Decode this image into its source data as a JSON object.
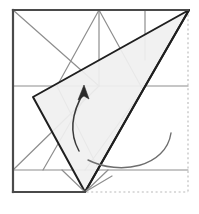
{
  "figure": {
    "canvas": {
      "width": 199,
      "height": 214,
      "background": "#ffffff"
    },
    "paper_square": {
      "label": "paper-outline",
      "x": 13,
      "y": 10,
      "width": 175,
      "height": 182,
      "solid_edges": [
        "top",
        "left"
      ],
      "dashed_edges": [
        "right",
        "bottom"
      ],
      "solid_color": "#4a4a4a",
      "dashed_color": "#b9b9b9",
      "solid_width": 2.2,
      "dashed_width": 1.1,
      "dash_pattern": "2,2.6"
    },
    "flap": {
      "label": "folded-flap",
      "points": "33,97 189,10 143,90 85,192",
      "fill": "#f0f0f0",
      "stroke": "#1f1f1f",
      "stroke_width": 2.0
    },
    "flap_inner_edges": [
      {
        "name": "flap-crease-apex-to-mid",
        "x1": 189,
        "y1": 10,
        "x2": 143,
        "y2": 90,
        "color": "#1f1f1f",
        "width": 2.0
      },
      {
        "name": "flap-crease-mid-to-base",
        "x1": 143,
        "y1": 90,
        "x2": 85,
        "y2": 192,
        "color": "#1f1f1f",
        "width": 2.0
      }
    ],
    "creases": [
      {
        "name": "crease-horizontal-upper",
        "x1": 13,
        "y1": 86,
        "x2": 188,
        "y2": 86,
        "color": "#8e8e8e",
        "width": 1.2
      },
      {
        "name": "crease-horizontal-lower",
        "x1": 13,
        "y1": 170,
        "x2": 188,
        "y2": 170,
        "color": "#8e8e8e",
        "width": 1.2
      },
      {
        "name": "crease-vertical-center",
        "x1": 99,
        "y1": 10,
        "x2": 99,
        "y2": 86,
        "color": "#8e8e8e",
        "width": 1.2
      },
      {
        "name": "crease-vertical-right",
        "x1": 145,
        "y1": 10,
        "x2": 145,
        "y2": 60,
        "color": "#8e8e8e",
        "width": 1.2
      },
      {
        "name": "crease-diagonal-topleft-down",
        "x1": 13,
        "y1": 10,
        "x2": 99,
        "y2": 86,
        "color": "#8e8e8e",
        "width": 1.2
      },
      {
        "name": "crease-diagonal-center-up-left",
        "x1": 99,
        "y1": 10,
        "x2": 57,
        "y2": 86,
        "color": "#8e8e8e",
        "width": 1.2
      },
      {
        "name": "crease-diagonal-center-up-right",
        "x1": 99,
        "y1": 10,
        "x2": 143,
        "y2": 90,
        "color": "#8e8e8e",
        "width": 1.2
      },
      {
        "name": "crease-diagonal-lower-left-rise",
        "x1": 13,
        "y1": 170,
        "x2": 99,
        "y2": 86,
        "color": "#8e8e8e",
        "width": 1.2
      },
      {
        "name": "crease-diagonal-valley-left",
        "x1": 43,
        "y1": 170,
        "x2": 85,
        "y2": 97,
        "color": "#8e8e8e",
        "width": 1.2
      },
      {
        "name": "crease-diagonal-valley-right",
        "x1": 143,
        "y1": 90,
        "x2": 85,
        "y2": 170,
        "color": "#8e8e8e",
        "width": 1.2
      },
      {
        "name": "crease-flap-interior-left",
        "x1": 57,
        "y1": 86,
        "x2": 99,
        "y2": 170,
        "color": "#8e8e8e",
        "width": 1.2
      },
      {
        "name": "crease-base-notch-left",
        "x1": 62,
        "y1": 170,
        "x2": 85,
        "y2": 192,
        "color": "#8e8e8e",
        "width": 1.2
      },
      {
        "name": "crease-base-notch-right",
        "x1": 108,
        "y1": 170,
        "x2": 85,
        "y2": 192,
        "color": "#8e8e8e",
        "width": 1.2
      },
      {
        "name": "crease-base-to-midpoint",
        "x1": 85,
        "y1": 192,
        "x2": 112,
        "y2": 176,
        "color": "#8e8e8e",
        "width": 1.2
      }
    ],
    "arrows": [
      {
        "name": "fold-direction-arrow",
        "type": "valley-fold-arrow",
        "path": "M 171,133 C 166,167 120,176 88,160",
        "color": "#6e6e6e",
        "width": 1.4,
        "has_head": false
      },
      {
        "name": "fold-up-arrow",
        "type": "fold-up-arrow",
        "path": "M 79,151 C 69,133 72,112 84,92",
        "color": "#3a3a3a",
        "width": 1.5,
        "has_head": true,
        "head_points": "84,85 89,99 84,96 78,100"
      }
    ]
  }
}
